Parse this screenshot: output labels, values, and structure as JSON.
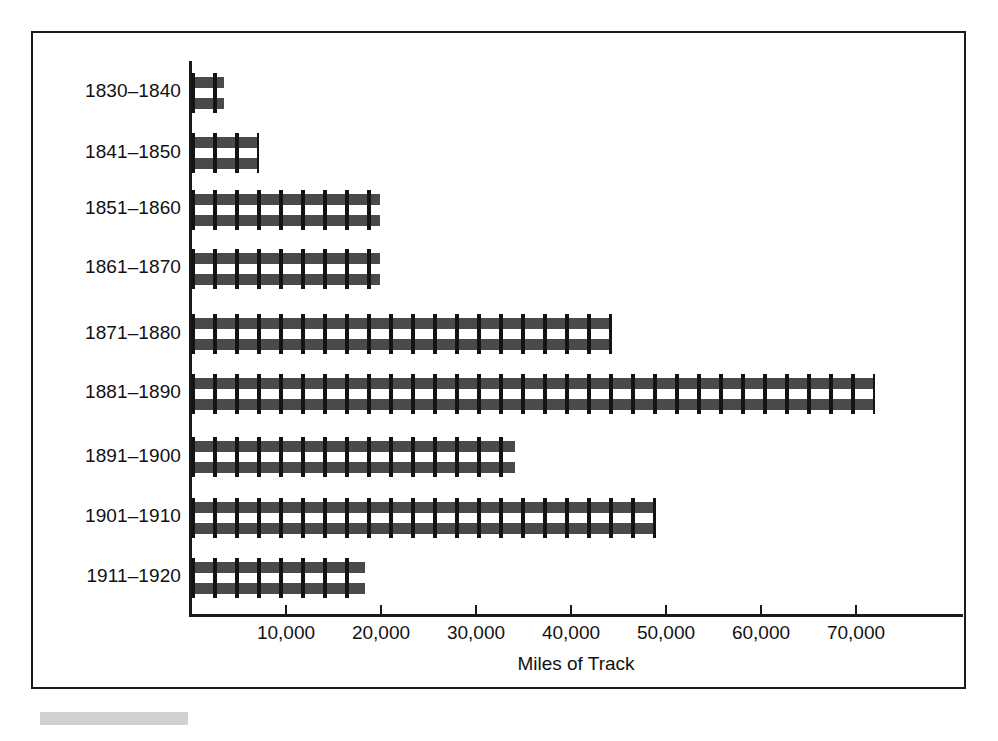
{
  "chart_data": {
    "type": "bar",
    "orientation": "horizontal",
    "title": "",
    "xlabel": "Miles of Track",
    "ylabel": "",
    "categories": [
      "1830–1840",
      "1841–1850",
      "1851–1860",
      "1861–1870",
      "1871–1880",
      "1881–1890",
      "1891–1900",
      "1901–1910",
      "1911–1920"
    ],
    "values": [
      3500,
      7200,
      19900,
      19900,
      44300,
      72000,
      34100,
      48900,
      18300
    ],
    "xlim": [
      0,
      81000
    ],
    "xticks": [
      10000,
      20000,
      30000,
      40000,
      50000,
      60000,
      70000
    ],
    "xtick_labels": [
      "10,000",
      "20,000",
      "30,000",
      "40,000",
      "50,000",
      "60,000",
      "70,000"
    ],
    "grid": false,
    "legend": null,
    "bar_style": "railroad-track",
    "colors": {
      "rail": "#4a4a4a",
      "tie": "#141414",
      "axis": "#1a1a1a",
      "frame": "#1a1a1a",
      "background": "#ffffff",
      "artifact": "#c9c9c9"
    }
  },
  "figure": {
    "axis_title": "Miles of Track"
  }
}
